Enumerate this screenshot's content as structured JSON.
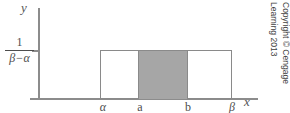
{
  "figure": {
    "type": "uniform-distribution-density-plot",
    "axes": {
      "y_axis_label": "y",
      "x_axis_label": "x"
    },
    "density_height_label": {
      "numerator": "1",
      "denominator": "β−α"
    },
    "x_tick_labels": {
      "alpha": "α",
      "a": "a",
      "b": "b",
      "beta": "β"
    },
    "colors": {
      "shaded_fill": "#a6a6a6",
      "rect_stroke": "#8a8a8a",
      "axis": "#8c8c8c",
      "text": "#4d4d4d",
      "background": "#ffffff"
    },
    "copyright": {
      "line1": "Copyright © Cengage",
      "line2": "Learning 2013"
    }
  }
}
